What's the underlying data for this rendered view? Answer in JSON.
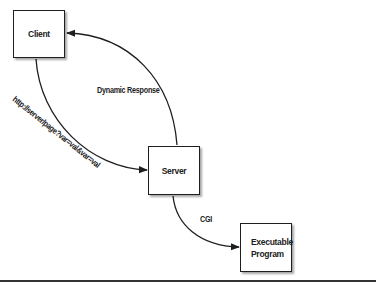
{
  "diagram": {
    "nodes": {
      "client": {
        "label": "Client"
      },
      "server": {
        "label": "Server"
      },
      "executable": {
        "line1": "Executable",
        "line2": "Program"
      }
    },
    "edges": {
      "request": {
        "label": "http://server/page?var=val&var=val",
        "from": "Client",
        "to": "Server"
      },
      "response": {
        "label": "Dynamic Response",
        "from": "Server",
        "to": "Client"
      },
      "cgi": {
        "label": "CGI",
        "from": "Server",
        "to": "Executable Program"
      }
    },
    "colors": {
      "stroke": "#1e1e1e",
      "background": "#ffffff",
      "text": "#222222"
    }
  }
}
